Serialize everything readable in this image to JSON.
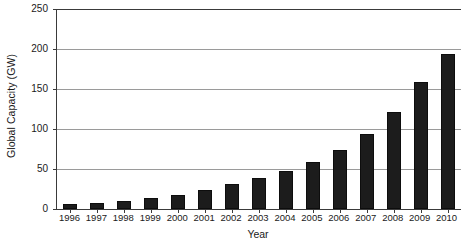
{
  "chart_data": {
    "type": "bar",
    "title": "",
    "xlabel": "Year",
    "ylabel": "Global Capacity (GW)",
    "categories": [
      "1996",
      "1997",
      "1998",
      "1999",
      "2000",
      "2001",
      "2002",
      "2003",
      "2004",
      "2005",
      "2006",
      "2007",
      "2008",
      "2009",
      "2010"
    ],
    "values": [
      6,
      8,
      10,
      14,
      18,
      24,
      31,
      39,
      47,
      59,
      74,
      94,
      121,
      159,
      194
    ],
    "ylim": [
      0,
      250
    ],
    "yticks": [
      0,
      50,
      100,
      150,
      200,
      250
    ],
    "ytick_labels": [
      "0",
      "50",
      "100",
      "150",
      "200",
      "250"
    ],
    "grid": "horizontal",
    "legend": "none",
    "bar_color": "#1c1c1c",
    "grid_color": "#9a9a9a",
    "axis_color": "#3a3a3a",
    "background": "#ffffff"
  }
}
